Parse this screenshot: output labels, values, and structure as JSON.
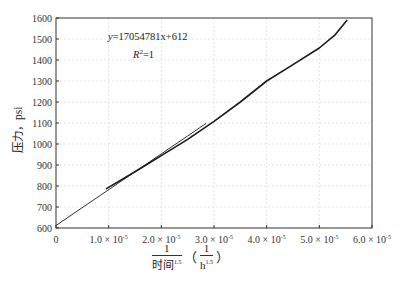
{
  "chart_data": {
    "type": "line",
    "title": "",
    "xlabel": "1/时间^1.5 (1/h^1.5)",
    "ylabel": "压力，psi",
    "xlim": [
      0,
      6e-05
    ],
    "ylim": [
      600,
      1600
    ],
    "grid": true,
    "x_ticks": [
      "0",
      "1.0 × 10⁻⁵",
      "2.0 × 10⁻⁵",
      "3.0 × 10⁻⁵",
      "4.0 × 10⁻⁵",
      "5.0 × 10⁻⁵",
      "6.0 × 10⁻⁵"
    ],
    "y_ticks": [
      "600",
      "700",
      "800",
      "900",
      "1000",
      "1100",
      "1200",
      "1300",
      "1400",
      "1500",
      "1600"
    ],
    "annotations": [
      "y=17054781x+612",
      "R²=1"
    ],
    "series": [
      {
        "name": "measured pressure",
        "x": [
          9.5e-06,
          1.5e-05,
          2e-05,
          2.5e-05,
          3e-05,
          3.5e-05,
          4e-05,
          4.5e-05,
          5e-05,
          5.3e-05,
          5.53e-05
        ],
        "y": [
          786,
          868,
          945,
          1022,
          1108,
          1200,
          1300,
          1378,
          1457,
          1520,
          1590
        ]
      },
      {
        "name": "linear fit",
        "x": [
          0,
          2.85e-05
        ],
        "y": [
          612,
          1098
        ]
      }
    ]
  },
  "labels": {
    "ylabel": "压力，psi",
    "xlabel_num": "1",
    "xlabel_den": "时间",
    "xlabel_den_exp": "1.5",
    "unit_num": "1",
    "unit_den": "h",
    "unit_den_exp": "1.5",
    "paren_open": "（",
    "paren_close": "）",
    "equation": "y=17054781x+612",
    "r2_base": "R",
    "r2_exp": "2",
    "r2_rest": "=1"
  }
}
